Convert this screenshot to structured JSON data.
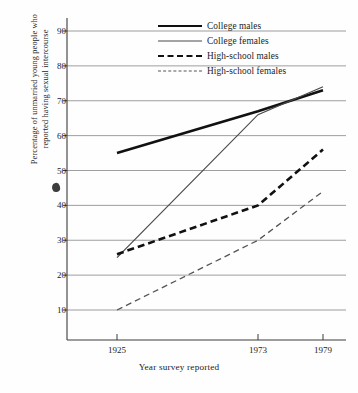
{
  "chart_data": {
    "type": "line",
    "title": "",
    "xlabel": "Year survey reported",
    "ylabel_line1": "Percentage of unmarried young people who",
    "ylabel_line2": "reported having sexual intercourse",
    "x": [
      1925,
      1973,
      1979
    ],
    "xtick_labels": [
      "1925",
      "1973",
      "1979"
    ],
    "ytick_labels": [
      "10",
      "20",
      "30",
      "40",
      "50",
      "60",
      "70",
      "80",
      "90"
    ],
    "ytick_values": [
      10,
      20,
      30,
      40,
      50,
      60,
      70,
      80,
      90
    ],
    "ylim": [
      5,
      93
    ],
    "xlim": [
      1919,
      1983
    ],
    "grid": "horizontal",
    "legend_position": "top-right-inside",
    "series": [
      {
        "name": "College males",
        "style": "solid-thick",
        "color": "#111111",
        "values": [
          55,
          67,
          73
        ]
      },
      {
        "name": "College females",
        "style": "solid-thin",
        "color": "#4a4a4a",
        "values": [
          25,
          66,
          74
        ]
      },
      {
        "name": "High-school males",
        "style": "dashed-thick",
        "color": "#111111",
        "values": [
          26,
          40,
          56
        ]
      },
      {
        "name": "High-school females",
        "style": "dashed-thin",
        "color": "#555555",
        "values": [
          10,
          30,
          44
        ]
      }
    ],
    "annotations": [
      {
        "name": "ink-smudge",
        "near_value": 45,
        "text": ""
      }
    ]
  },
  "legend": {
    "items": [
      {
        "label": "College males"
      },
      {
        "label": "College females"
      },
      {
        "label": "High-school males"
      },
      {
        "label": "High-school females"
      }
    ]
  }
}
